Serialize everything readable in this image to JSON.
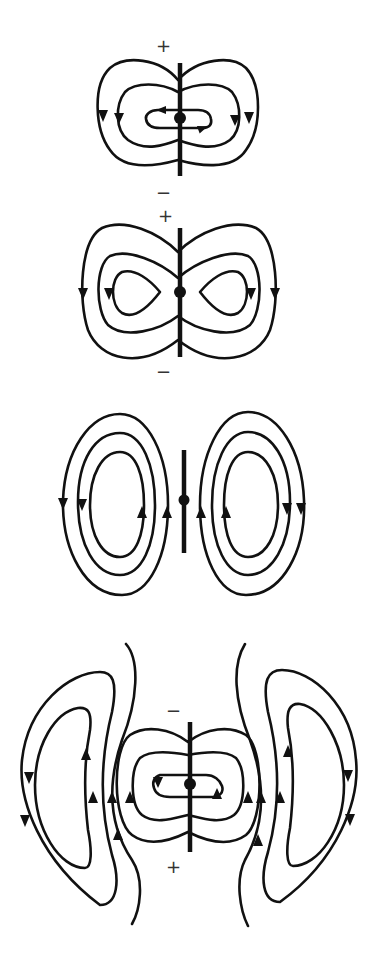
{
  "figure": {
    "colors": {
      "ink": "#111111",
      "background": "#ffffff"
    },
    "panels": [
      {
        "id": "phase-1",
        "top_sign": "+",
        "bottom_sign": "−",
        "note": "closed loops around dipole, field lines still attached"
      },
      {
        "id": "phase-2",
        "top_sign": "+",
        "bottom_sign": "−",
        "note": "figure-eight pinching of field lines"
      },
      {
        "id": "phase-3",
        "top_sign": "",
        "bottom_sign": "",
        "note": "detached closed loops on both sides, charges at zero"
      },
      {
        "id": "phase-4",
        "top_sign": "−",
        "bottom_sign": "+",
        "note": "new loops forming near dipole, detached loops propagating outward"
      }
    ]
  }
}
